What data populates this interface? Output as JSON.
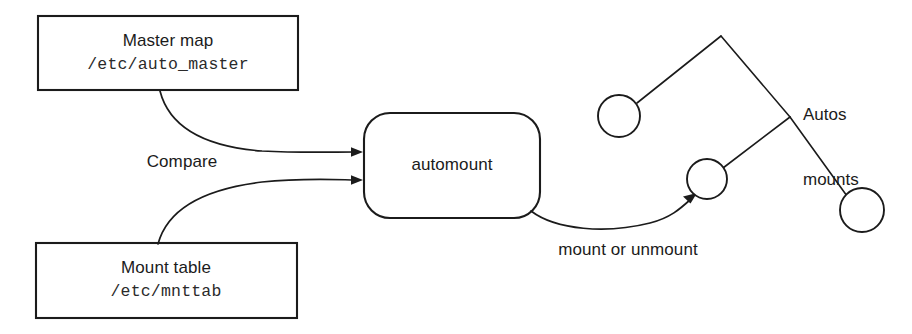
{
  "diagram": {
    "colors": {
      "stroke": "#1b1b1b",
      "background": "#ffffff",
      "mono_text": "#2a2a2a"
    },
    "boxes": [
      {
        "id": "master-map",
        "title": "Master map",
        "path": "/etc/auto_master"
      },
      {
        "id": "mount-table",
        "title": "Mount table",
        "path": "/etc/mnttab"
      }
    ],
    "process": {
      "id": "automount",
      "label": "automount"
    },
    "edge_labels": {
      "compare": "Compare",
      "mount_or_unmount": "mount or unmount"
    },
    "tree": {
      "label_line1": "Autos",
      "label_line2": "mounts",
      "node_count": 3
    }
  }
}
